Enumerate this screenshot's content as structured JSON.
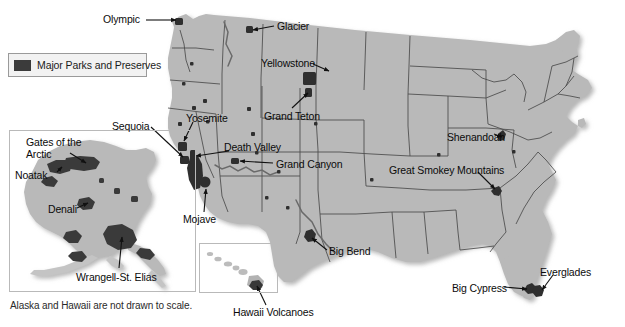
{
  "figure": {
    "background_color": "#ffffff",
    "land_fill_color": "#b9b9b9",
    "border_color": "#4a4a4a",
    "park_color": "#3b3b3b",
    "leader_line_color": "#111111"
  },
  "legend": {
    "label": "Major Parks and Preserves",
    "swatch_color": "#3b3b3b",
    "box_fill": "#f2f2f2",
    "box_border": "#9a9a9a"
  },
  "footnote": {
    "text": "Alaska and Hawaii are not drawn to scale."
  },
  "insets": [
    {
      "name": "alaska-inset",
      "label": "Alaska"
    },
    {
      "name": "hawaii-inset",
      "label": "Hawaii"
    }
  ],
  "labels": [
    {
      "id": "olympic",
      "text": "Olympic",
      "x": 103,
      "y": 14,
      "region": "mainland"
    },
    {
      "id": "glacier",
      "text": "Glacier",
      "x": 277,
      "y": 21,
      "region": "mainland"
    },
    {
      "id": "yellowstone",
      "text": "Yellowstone",
      "x": 261,
      "y": 58,
      "region": "mainland"
    },
    {
      "id": "grand-teton",
      "text": "Grand Teton",
      "x": 264,
      "y": 111,
      "region": "mainland"
    },
    {
      "id": "yosemite",
      "text": "Yosemite",
      "x": 186,
      "y": 113,
      "region": "mainland"
    },
    {
      "id": "sequoia",
      "text": "Sequoia",
      "x": 112,
      "y": 121,
      "region": "mainland"
    },
    {
      "id": "death-valley",
      "text": "Death Valley",
      "x": 224,
      "y": 142,
      "region": "mainland"
    },
    {
      "id": "grand-canyon",
      "text": "Grand Canyon",
      "x": 276,
      "y": 159,
      "region": "mainland"
    },
    {
      "id": "mojave",
      "text": "Mojave",
      "x": 183,
      "y": 214,
      "region": "mainland"
    },
    {
      "id": "shenandoah",
      "text": "Shenandoah",
      "x": 447,
      "y": 132,
      "region": "mainland"
    },
    {
      "id": "great-smokey",
      "text": "Great Smokey Mountains",
      "x": 389,
      "y": 165,
      "region": "mainland"
    },
    {
      "id": "big-bend",
      "text": "Big Bend",
      "x": 329,
      "y": 246,
      "region": "mainland"
    },
    {
      "id": "big-cypress",
      "text": "Big Cypress",
      "x": 452,
      "y": 283,
      "region": "mainland"
    },
    {
      "id": "everglades",
      "text": "Everglades",
      "x": 540,
      "y": 267,
      "region": "mainland"
    },
    {
      "id": "gates-arctic",
      "text": "Gates of the Arctic",
      "x": 26,
      "y": 136,
      "region": "alaska"
    },
    {
      "id": "noatak",
      "text": "Noatak",
      "x": 15,
      "y": 170,
      "region": "alaska"
    },
    {
      "id": "denali",
      "text": "Denali",
      "x": 48,
      "y": 204,
      "region": "alaska"
    },
    {
      "id": "wrangell",
      "text": "Wrangell-St. Elias",
      "x": 76,
      "y": 272,
      "region": "alaska"
    },
    {
      "id": "hawaii-volc",
      "text": "Hawaii Volcanoes",
      "x": 233,
      "y": 307,
      "region": "hawaii"
    }
  ],
  "parks": [
    {
      "name": "Olympic",
      "region": "mainland"
    },
    {
      "name": "Glacier",
      "region": "mainland"
    },
    {
      "name": "Yellowstone",
      "region": "mainland"
    },
    {
      "name": "Grand Teton",
      "region": "mainland"
    },
    {
      "name": "Yosemite",
      "region": "mainland"
    },
    {
      "name": "Sequoia",
      "region": "mainland"
    },
    {
      "name": "Death Valley",
      "region": "mainland"
    },
    {
      "name": "Grand Canyon",
      "region": "mainland"
    },
    {
      "name": "Mojave",
      "region": "mainland"
    },
    {
      "name": "Shenandoah",
      "region": "mainland"
    },
    {
      "name": "Great Smokey Mountains",
      "region": "mainland"
    },
    {
      "name": "Big Bend",
      "region": "mainland"
    },
    {
      "name": "Big Cypress",
      "region": "mainland"
    },
    {
      "name": "Everglades",
      "region": "mainland"
    },
    {
      "name": "Gates of the Arctic",
      "region": "alaska"
    },
    {
      "name": "Noatak",
      "region": "alaska"
    },
    {
      "name": "Denali",
      "region": "alaska"
    },
    {
      "name": "Wrangell-St. Elias",
      "region": "alaska"
    },
    {
      "name": "Hawaii Volcanoes",
      "region": "hawaii"
    }
  ]
}
